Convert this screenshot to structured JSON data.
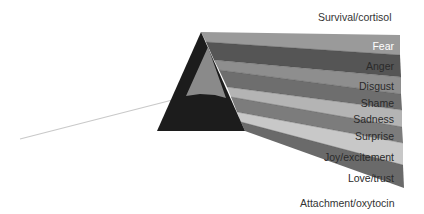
{
  "diagram": {
    "top_label": "Survival/cortisol",
    "bottom_label": "Attachment/oxytocin",
    "bands": [
      {
        "label": "Fear",
        "color": "#9a9a9a",
        "text_color": "#ffffff"
      },
      {
        "label": "Anger",
        "color": "#555555",
        "text_color": "#2a2a2a"
      },
      {
        "label": "Disgust",
        "color": "#8e8e8e",
        "text_color": "#2a2a2a"
      },
      {
        "label": "Shame",
        "color": "#6e6e6e",
        "text_color": "#2a2a2a"
      },
      {
        "label": "Sadness",
        "color": "#b4b4b4",
        "text_color": "#2a2a2a"
      },
      {
        "label": "Surprise",
        "color": "#7c7c7c",
        "text_color": "#2a2a2a"
      },
      {
        "label": "Joy/excitement",
        "color": "#c8c8c8",
        "text_color": "#2a2a2a"
      },
      {
        "label": "Love/trust",
        "color": "#6a6a6a",
        "text_color": "#2a2a2a"
      }
    ],
    "prism_color": "#1c1c1c",
    "inner_prism_color": "#8a8a8a",
    "ray_color": "#c9c9c9"
  }
}
